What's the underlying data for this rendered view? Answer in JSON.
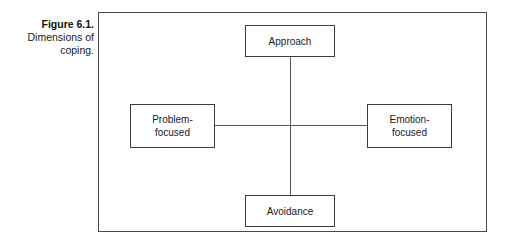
{
  "caption": {
    "title": "Figure 6.1.",
    "lines": [
      "Dimensions of",
      "coping."
    ]
  },
  "figure": {
    "frame_border_color": "#4a4a4a",
    "background_color": "#ffffff"
  },
  "diagram": {
    "type": "concept-cross",
    "node_border_color": "#3c3c3c",
    "connector_color": "#55585c",
    "nodes": [
      {
        "id": "approach",
        "label": "Approach",
        "position": "top"
      },
      {
        "id": "problem-focused",
        "label": "Problem-\nfocused",
        "position": "left"
      },
      {
        "id": "emotion-focused",
        "label": "Emotion-\nfocused",
        "position": "right"
      },
      {
        "id": "avoidance",
        "label": "Avoidance",
        "position": "bottom"
      }
    ],
    "connectors": [
      {
        "id": "vertical",
        "from": "approach",
        "to": "avoidance"
      },
      {
        "id": "horizontal",
        "from": "problem-focused",
        "to": "emotion-focused"
      }
    ]
  }
}
